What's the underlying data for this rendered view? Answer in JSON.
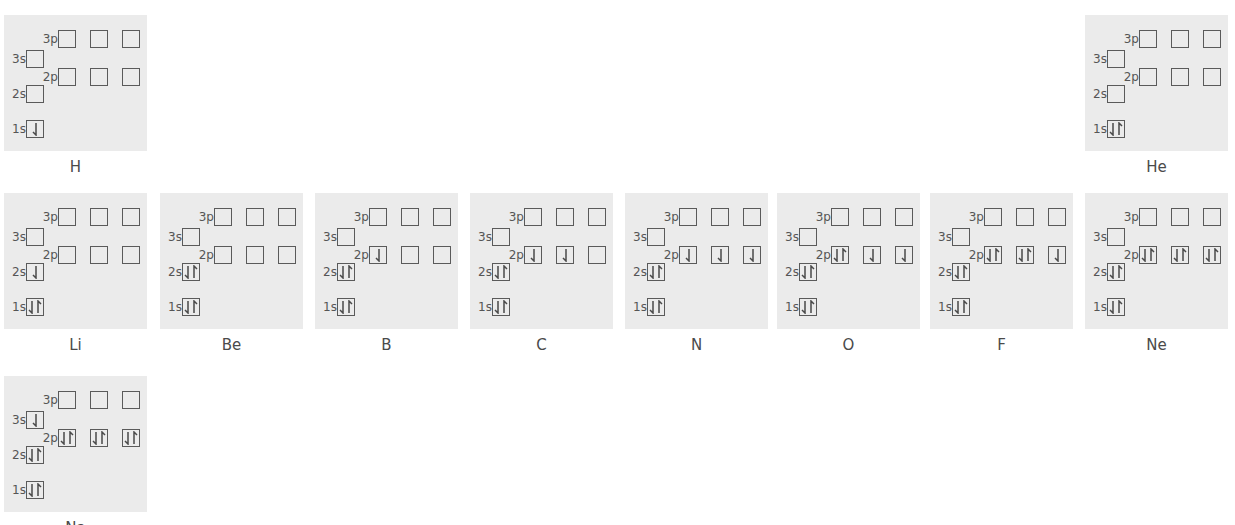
{
  "figure": {
    "orbital_labels": {
      "1s": "1s",
      "2s": "2s",
      "3s": "3s",
      "2p": "2p",
      "3p": "3p"
    },
    "arrow_legend": {
      "down": "spin-down electron (half arrow)",
      "up": "spin-up electron (half arrow)",
      "pair": "paired electrons (down + up)"
    },
    "colors": {
      "panel_bg": "#ebebeb",
      "box_border": "#5a5a5a",
      "text": "#555555"
    }
  },
  "elements": [
    {
      "symbol": "H",
      "row": 0,
      "col": 0,
      "orbitals": {
        "1s": [
          "d"
        ],
        "2s": [],
        "3s": [],
        "2p": [
          [],
          [],
          []
        ],
        "3p": [
          [],
          [],
          []
        ]
      }
    },
    {
      "symbol": "He",
      "row": 0,
      "col": 7,
      "orbitals": {
        "1s": [
          "d",
          "u"
        ],
        "2s": [],
        "3s": [],
        "2p": [
          [],
          [],
          []
        ],
        "3p": [
          [],
          [],
          []
        ]
      }
    },
    {
      "symbol": "Li",
      "row": 1,
      "col": 0,
      "orbitals": {
        "1s": [
          "d",
          "u"
        ],
        "2s": [
          "d"
        ],
        "3s": [],
        "2p": [
          [],
          [],
          []
        ],
        "3p": [
          [],
          [],
          []
        ]
      }
    },
    {
      "symbol": "Be",
      "row": 1,
      "col": 1,
      "orbitals": {
        "1s": [
          "d",
          "u"
        ],
        "2s": [
          "d",
          "u"
        ],
        "3s": [],
        "2p": [
          [],
          [],
          []
        ],
        "3p": [
          [],
          [],
          []
        ]
      }
    },
    {
      "symbol": "B",
      "row": 1,
      "col": 2,
      "orbitals": {
        "1s": [
          "d",
          "u"
        ],
        "2s": [
          "d",
          "u"
        ],
        "3s": [],
        "2p": [
          [
            "d"
          ],
          [],
          []
        ],
        "3p": [
          [],
          [],
          []
        ]
      }
    },
    {
      "symbol": "C",
      "row": 1,
      "col": 3,
      "orbitals": {
        "1s": [
          "d",
          "u"
        ],
        "2s": [
          "d",
          "u"
        ],
        "3s": [],
        "2p": [
          [
            "d"
          ],
          [
            "d"
          ],
          []
        ],
        "3p": [
          [],
          [],
          []
        ]
      }
    },
    {
      "symbol": "N",
      "row": 1,
      "col": 4,
      "orbitals": {
        "1s": [
          "d",
          "u"
        ],
        "2s": [
          "d",
          "u"
        ],
        "3s": [],
        "2p": [
          [
            "d"
          ],
          [
            "d"
          ],
          [
            "d"
          ]
        ],
        "3p": [
          [],
          [],
          []
        ]
      }
    },
    {
      "symbol": "O",
      "row": 1,
      "col": 5,
      "orbitals": {
        "1s": [
          "d",
          "u"
        ],
        "2s": [
          "d",
          "u"
        ],
        "3s": [],
        "2p": [
          [
            "d",
            "u"
          ],
          [
            "d"
          ],
          [
            "d"
          ]
        ],
        "3p": [
          [],
          [],
          []
        ]
      }
    },
    {
      "symbol": "F",
      "row": 1,
      "col": 6,
      "orbitals": {
        "1s": [
          "d",
          "u"
        ],
        "2s": [
          "d",
          "u"
        ],
        "3s": [],
        "2p": [
          [
            "d",
            "u"
          ],
          [
            "d",
            "u"
          ],
          [
            "d"
          ]
        ],
        "3p": [
          [],
          [],
          []
        ]
      }
    },
    {
      "symbol": "Ne",
      "row": 1,
      "col": 7,
      "orbitals": {
        "1s": [
          "d",
          "u"
        ],
        "2s": [
          "d",
          "u"
        ],
        "3s": [],
        "2p": [
          [
            "d",
            "u"
          ],
          [
            "d",
            "u"
          ],
          [
            "d",
            "u"
          ]
        ],
        "3p": [
          [],
          [],
          []
        ]
      }
    },
    {
      "symbol": "Na",
      "row": 2,
      "col": 0,
      "orbitals": {
        "1s": [
          "d",
          "u"
        ],
        "2s": [
          "d",
          "u"
        ],
        "3s": [
          "d"
        ],
        "2p": [
          [
            "d",
            "u"
          ],
          [
            "d",
            "u"
          ],
          [
            "d",
            "u"
          ]
        ],
        "3p": [
          [],
          [],
          []
        ]
      }
    }
  ]
}
